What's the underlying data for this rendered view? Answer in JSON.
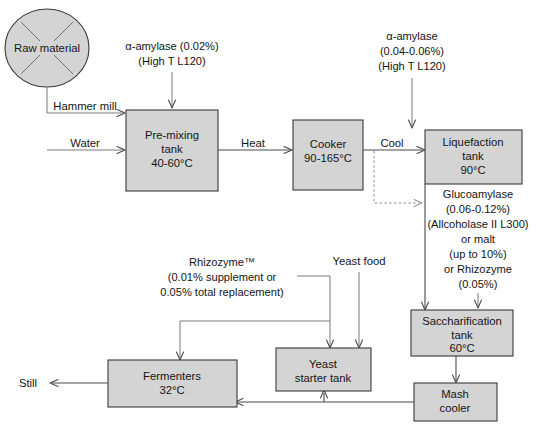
{
  "diagram": {
    "type": "process-flow-diagram",
    "colors": {
      "box_fill": "#d4d4d4",
      "box_stroke": "#3a3a3a",
      "line": "#4a4a4a",
      "dotted_line": "#8a8a8a",
      "text": "#141414",
      "background": "#ffffff"
    },
    "nodes": {
      "raw_material": {
        "label": "Raw material",
        "shape": "circle"
      },
      "pre_mixing_tank": {
        "line1": "Pre-mixing",
        "line2": "tank",
        "line3": "40-60°C",
        "shape": "rect"
      },
      "cooker": {
        "line1": "Cooker",
        "line2": "90-165°C",
        "shape": "rect"
      },
      "liquefaction_tank": {
        "line1": "Liquefaction",
        "line2": "tank",
        "line3": "90°C",
        "shape": "rect"
      },
      "saccharification_tank": {
        "line1": "Saccharification",
        "line2": "tank",
        "line3": "60°C",
        "shape": "rect"
      },
      "mash_cooler": {
        "line1": "Mash",
        "line2": "cooler",
        "shape": "rect"
      },
      "yeast_starter_tank": {
        "line1": "Yeast",
        "line2": "starter tank",
        "shape": "rect"
      },
      "fermenters": {
        "line1": "Fermenters",
        "line2": "32°C",
        "shape": "rect"
      }
    },
    "edge_labels": {
      "hammer_mill": "Hammer mill",
      "water": "Water",
      "heat": "Heat",
      "cool": "Cool",
      "still": "Still",
      "yeast_food": "Yeast food"
    },
    "annotations": {
      "alpha_amylase_1": {
        "line1": "α-amylase (0.02%)",
        "line2": "(High T L120)"
      },
      "alpha_amylase_2": {
        "line1": "α-amylase",
        "line2": "(0.04-0.06%)",
        "line3": "(High T L120)"
      },
      "glucoamylase": {
        "line1": "Glucoamylase",
        "line2": "(0.06-0.12%)",
        "line3": "(Allcoholase II L300)",
        "line4": "or malt",
        "line5": "(up to 10%)",
        "line6": "or Rhizozyme",
        "line7": "(0.05%)"
      },
      "rhizozyme": {
        "line1": "Rhizozyme™",
        "line2": "(0.01% supplement or",
        "line3": "0.05% total replacement)"
      }
    }
  }
}
